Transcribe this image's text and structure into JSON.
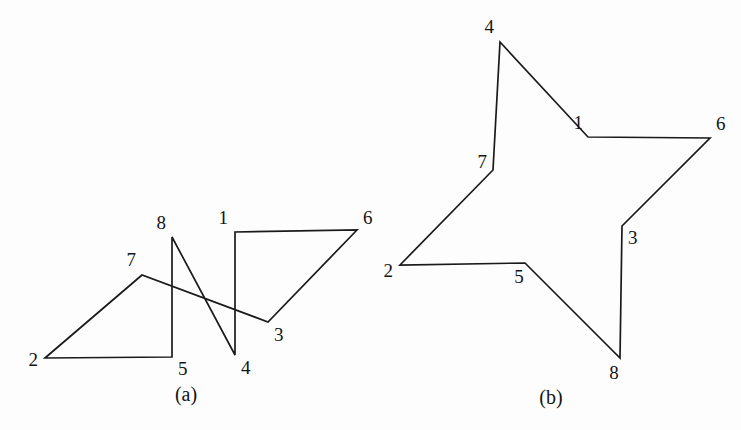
{
  "figure": {
    "background_color": "#fdfdfd",
    "stroke_color": "#1a1a1a",
    "text_color": "#141414",
    "width": 741,
    "height": 430
  },
  "chart_data": {
    "type": "diagram",
    "title": "",
    "panels": [
      {
        "id": "a",
        "caption": "(a)",
        "caption_position": {
          "x": 186,
          "y": 401
        },
        "polygon_order": [
          "1",
          "2",
          "3",
          "4",
          "5",
          "6",
          "7",
          "8"
        ],
        "closed": true,
        "self_intersecting": true,
        "edges": [
          [
            "7",
            "2"
          ],
          [
            "2",
            "5"
          ],
          [
            "5",
            "8"
          ],
          [
            "8",
            "4"
          ],
          [
            "4",
            "1"
          ],
          [
            "1",
            "6"
          ],
          [
            "6",
            "3"
          ],
          [
            "3",
            "7"
          ]
        ],
        "vertices": [
          {
            "label": "1",
            "x": 235,
            "y": 232,
            "label_x": 228,
            "label_y": 224,
            "label_anchor": "end"
          },
          {
            "label": "2",
            "x": 45,
            "y": 358,
            "label_x": 38,
            "label_y": 366,
            "label_anchor": "end"
          },
          {
            "label": "3",
            "x": 268,
            "y": 322,
            "label_x": 274,
            "label_y": 341,
            "label_anchor": "start"
          },
          {
            "label": "4",
            "x": 235,
            "y": 355,
            "label_x": 241,
            "label_y": 374,
            "label_anchor": "start"
          },
          {
            "label": "5",
            "x": 172,
            "y": 357,
            "label_x": 178,
            "label_y": 375,
            "label_anchor": "start"
          },
          {
            "label": "6",
            "x": 357,
            "y": 230,
            "label_x": 363,
            "label_y": 224,
            "label_anchor": "start"
          },
          {
            "label": "7",
            "x": 142,
            "y": 275,
            "label_x": 136,
            "label_y": 266,
            "label_anchor": "end"
          },
          {
            "label": "8",
            "x": 172,
            "y": 237,
            "label_x": 166,
            "label_y": 229,
            "label_anchor": "end"
          }
        ]
      },
      {
        "id": "b",
        "caption": "(b)",
        "caption_position": {
          "x": 551,
          "y": 404
        },
        "polygon_order": [
          "4",
          "1",
          "6",
          "3",
          "8",
          "5",
          "2",
          "7"
        ],
        "closed": true,
        "self_intersecting": false,
        "edges": [
          [
            "4",
            "1"
          ],
          [
            "1",
            "6"
          ],
          [
            "6",
            "3"
          ],
          [
            "3",
            "8"
          ],
          [
            "8",
            "5"
          ],
          [
            "5",
            "2"
          ],
          [
            "2",
            "7"
          ],
          [
            "7",
            "4"
          ]
        ],
        "vertices": [
          {
            "label": "4",
            "x": 500,
            "y": 42,
            "label_x": 494,
            "label_y": 33,
            "label_anchor": "end"
          },
          {
            "label": "1",
            "x": 588,
            "y": 137,
            "label_x": 583,
            "label_y": 129,
            "label_anchor": "end"
          },
          {
            "label": "6",
            "x": 710,
            "y": 138,
            "label_x": 716,
            "label_y": 130,
            "label_anchor": "start"
          },
          {
            "label": "3",
            "x": 622,
            "y": 226,
            "label_x": 628,
            "label_y": 244,
            "label_anchor": "start"
          },
          {
            "label": "8",
            "x": 620,
            "y": 358,
            "label_x": 614,
            "label_y": 379,
            "label_anchor": "middle"
          },
          {
            "label": "5",
            "x": 525,
            "y": 263,
            "label_x": 519,
            "label_y": 283,
            "label_anchor": "middle"
          },
          {
            "label": "2",
            "x": 400,
            "y": 265,
            "label_x": 393,
            "label_y": 277,
            "label_anchor": "end"
          },
          {
            "label": "7",
            "x": 493,
            "y": 170,
            "label_x": 487,
            "label_y": 168,
            "label_anchor": "end"
          }
        ]
      }
    ]
  }
}
